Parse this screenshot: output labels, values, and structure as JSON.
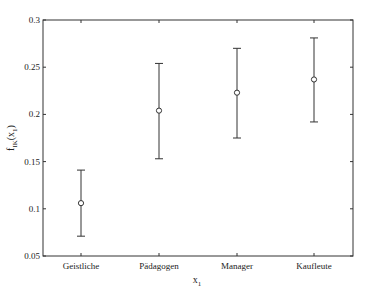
{
  "chart_data": {
    "type": "errorbar",
    "title": "",
    "xlabel": "x",
    "xlabel_sub": "1",
    "ylabel": "f",
    "ylabel_sub": "IK",
    "ylabel_arg": "(x",
    "ylabel_arg_sub": "1",
    "ylabel_close": ")",
    "categories": [
      "Geistliche",
      "Pädagogen",
      "Manager",
      "Kaufleute"
    ],
    "values": [
      0.106,
      0.204,
      0.223,
      0.237
    ],
    "lower": [
      0.071,
      0.153,
      0.175,
      0.192
    ],
    "upper": [
      0.141,
      0.254,
      0.27,
      0.281
    ],
    "ylim": [
      0.05,
      0.3
    ],
    "yticks": [
      "0.05",
      "0.1",
      "0.15",
      "0.2",
      "0.25",
      "0.3"
    ],
    "grid": false,
    "legend": null,
    "colors": {
      "line": "#333333",
      "axis": "#333333"
    }
  }
}
